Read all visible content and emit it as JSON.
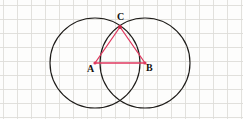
{
  "figure": {
    "background_color": "#fdfdfc",
    "grid": {
      "visible": true,
      "cell_size": 14,
      "origin_x": 3,
      "origin_y": 5,
      "line_color": "#d9d8d4",
      "line_width": 0.9
    },
    "circles": [
      {
        "name": "circle-left",
        "cx": 95,
        "cy": 63,
        "r": 45,
        "stroke": "#1d1b18",
        "stroke_width": 1.15
      },
      {
        "name": "circle-right",
        "cx": 145,
        "cy": 63,
        "r": 45,
        "stroke": "#1d1b18",
        "stroke_width": 1.15
      }
    ],
    "triangle": {
      "name": "triangle-ABC",
      "stroke": "#e0395f",
      "stroke_width": 1.3,
      "fill": "none",
      "points": "95,63 145,63 120,27"
    },
    "vertices": [
      {
        "id": "A",
        "label": "A",
        "x": 95,
        "y": 63
      },
      {
        "id": "B",
        "label": "B",
        "x": 145,
        "y": 63
      },
      {
        "id": "C",
        "label": "C",
        "x": 120,
        "y": 27
      }
    ],
    "vertex_dot": {
      "radius": 1.6,
      "color": "#e0395f"
    },
    "segments": [
      {
        "name": "segment-AB",
        "from": "A",
        "to": "B"
      },
      {
        "name": "segment-AC",
        "from": "A",
        "to": "C"
      },
      {
        "name": "segment-BC",
        "from": "B",
        "to": "C"
      }
    ],
    "intersections": [
      {
        "name": "intersection-top",
        "x": 120,
        "y": 27
      },
      {
        "name": "intersection-bottom",
        "x": 120,
        "y": 108
      }
    ]
  }
}
